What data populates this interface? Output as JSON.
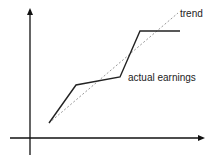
{
  "chart_data": {
    "type": "line",
    "title": "",
    "xlabel": "",
    "ylabel": "",
    "grid": false,
    "series": [
      {
        "name": "actual earnings",
        "style": "solid",
        "color": "#222222",
        "points": [
          [
            49,
            123
          ],
          [
            76,
            85
          ],
          [
            120,
            77
          ],
          [
            140,
            31
          ],
          [
            180,
            31
          ]
        ]
      },
      {
        "name": "trend",
        "style": "dashed",
        "color": "#999999",
        "points": [
          [
            49,
            123
          ],
          [
            178,
            13
          ]
        ]
      }
    ],
    "annotations": [
      {
        "text": "trend",
        "x": 180,
        "y": 9
      },
      {
        "text": "actual earnings",
        "x": 128,
        "y": 73
      }
    ]
  },
  "labels": {
    "trend": "trend",
    "actual": "actual earnings"
  },
  "colors": {
    "axis": "#111111",
    "actual": "#222222",
    "trend": "#999999"
  }
}
